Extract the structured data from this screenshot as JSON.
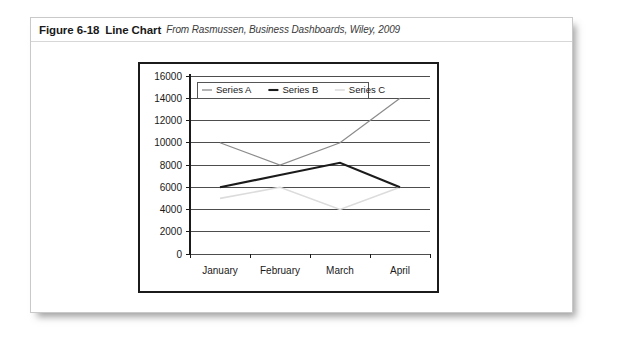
{
  "figure": {
    "number": "Figure 6-18",
    "title": "Line Chart",
    "source": "From Rasmussen, Business Dashboards, Wiley, 2009"
  },
  "colors": {
    "series_a": "#8c8c8c",
    "series_b": "#1b1b1b",
    "series_c": "#dcdcdc",
    "grid": "#4d4d4d",
    "axis": "#1a1a1a",
    "frame": "#1b1b1b",
    "card_border": "#c9c9c9",
    "text": "#1a1a1a"
  },
  "chart_data": {
    "type": "line",
    "title": "",
    "xlabel": "",
    "ylabel": "",
    "categories": [
      "January",
      "February",
      "March",
      "April"
    ],
    "series": [
      {
        "name": "Series A",
        "values": [
          10000,
          8000,
          10000,
          14000
        ],
        "color": "#8c8c8c"
      },
      {
        "name": "Series B",
        "values": [
          6000,
          7100,
          8200,
          6000
        ],
        "color": "#1b1b1b"
      },
      {
        "name": "Series C",
        "values": [
          5000,
          6000,
          4000,
          6000
        ],
        "color": "#dcdcdc"
      }
    ],
    "ylim": [
      0,
      16000
    ],
    "ytick_step": 2000,
    "yticks": [
      0,
      2000,
      4000,
      6000,
      8000,
      10000,
      12000,
      14000,
      16000
    ],
    "ytick_labels": [
      "0",
      "2000",
      "4000",
      "6000",
      "8000",
      "10000",
      "12000",
      "14000",
      "16000"
    ],
    "grid": true,
    "grid_axis": "y",
    "legend": true,
    "legend_position": "top-left-inside",
    "legend_entries": [
      "Series A",
      "Series B",
      "Series C"
    ]
  }
}
